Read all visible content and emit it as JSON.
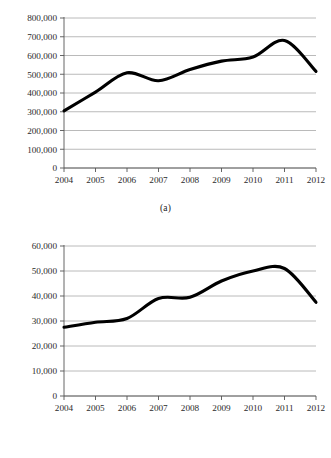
{
  "figure": {
    "background_color": "#ffffff",
    "line_color": "#000000",
    "grid_color": "#a8a8a8",
    "axis_color": "#555555"
  },
  "panels": [
    {
      "caption": "(a)",
      "y_tick_labels": [
        "800,000",
        "700,000",
        "600,000",
        "500,000",
        "400,000",
        "300,000",
        "200,000",
        "100,000",
        "0"
      ],
      "x_tick_labels": [
        "2004",
        "2005",
        "2006",
        "2007",
        "2008",
        "2009",
        "2010",
        "2011",
        "2012"
      ]
    },
    {
      "caption": "(b)",
      "y_tick_labels": [
        "60,000",
        "50,000",
        "40,000",
        "30,000",
        "20,000",
        "10,000",
        "0"
      ],
      "x_tick_labels": [
        "2004",
        "2005",
        "2006",
        "2007",
        "2008",
        "2009",
        "2010",
        "2011",
        "2012"
      ]
    }
  ],
  "chart_data": [
    {
      "type": "line",
      "title": "",
      "subtitle": "",
      "caption": "(a)",
      "xlabel": "",
      "ylabel": "",
      "x": [
        2004,
        2005,
        2006,
        2007,
        2008,
        2009,
        2010,
        2011,
        2012
      ],
      "categories": [
        "2004",
        "2005",
        "2006",
        "2007",
        "2008",
        "2009",
        "2010",
        "2011",
        "2012"
      ],
      "values": [
        305000,
        405000,
        508000,
        465000,
        525000,
        570000,
        592000,
        680000,
        515000
      ],
      "xlim": [
        2004,
        2012
      ],
      "ylim": [
        0,
        800000
      ],
      "y_ticks": [
        0,
        100000,
        200000,
        300000,
        400000,
        500000,
        600000,
        700000,
        800000
      ],
      "y_tick_labels": [
        "0",
        "100,000",
        "200,000",
        "300,000",
        "400,000",
        "500,000",
        "600,000",
        "700,000",
        "800,000"
      ],
      "x_ticks": [
        2004,
        2005,
        2006,
        2007,
        2008,
        2009,
        2010,
        2011,
        2012
      ],
      "grid": true,
      "grid_axis": "y",
      "legend": false,
      "legend_position": "none",
      "smoothing": "spline",
      "line_color": "#000000",
      "line_width": 3.1
    },
    {
      "type": "line",
      "title": "",
      "subtitle": "",
      "caption": "(b)",
      "xlabel": "",
      "ylabel": "",
      "x": [
        2004,
        2005,
        2006,
        2007,
        2008,
        2009,
        2010,
        2011,
        2012
      ],
      "categories": [
        "2004",
        "2005",
        "2006",
        "2007",
        "2008",
        "2009",
        "2010",
        "2011",
        "2012"
      ],
      "values": [
        27500,
        29500,
        31000,
        39000,
        39500,
        46000,
        50000,
        51000,
        37500
      ],
      "xlim": [
        2004,
        2012
      ],
      "ylim": [
        0,
        60000
      ],
      "y_ticks": [
        0,
        10000,
        20000,
        30000,
        40000,
        50000,
        60000
      ],
      "y_tick_labels": [
        "0",
        "10,000",
        "20,000",
        "30,000",
        "40,000",
        "50,000",
        "60,000"
      ],
      "x_ticks": [
        2004,
        2005,
        2006,
        2007,
        2008,
        2009,
        2010,
        2011,
        2012
      ],
      "grid": true,
      "grid_axis": "y",
      "legend": false,
      "legend_position": "none",
      "smoothing": "spline",
      "line_color": "#000000",
      "line_width": 3.1
    }
  ]
}
